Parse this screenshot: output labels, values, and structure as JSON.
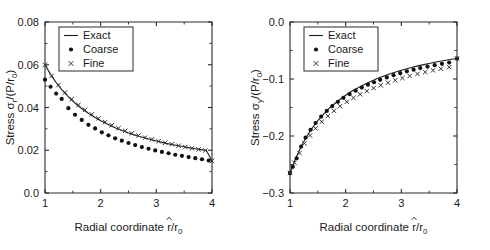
{
  "figure": {
    "background": "#ffffff",
    "foreground": "#1a1a1a",
    "panel_count": 2
  },
  "chart_data": [
    {
      "id": "left",
      "type": "line",
      "title": "",
      "xlabel": "Radial coordinate r̂/r₀",
      "xlabel_parts": {
        "prefix": "Radial coordinate ",
        "hat_var": "r",
        "divider": "/r",
        "sub": "0"
      },
      "ylabel": "Stress σr/(P/r₀)",
      "ylabel_parts": {
        "prefix": "Stress ",
        "sym": "σ",
        "sym_sub": "r",
        "mid": "/(P/r",
        "sub": "0",
        "suffix": ")"
      },
      "xlim": [
        1,
        4
      ],
      "ylim": [
        0.0,
        0.08
      ],
      "xticks": [
        1,
        2,
        3,
        4
      ],
      "xticklabels": [
        "1",
        "2",
        "3",
        "4"
      ],
      "yticks": [
        0.0,
        0.02,
        0.04,
        0.06,
        0.08
      ],
      "yticklabels": [
        "0.0",
        "0.02",
        "0.04",
        "0.06",
        "0.08"
      ],
      "grid": false,
      "legend_position": "upper-left",
      "legend": [
        {
          "label": "Exact",
          "marker": "line"
        },
        {
          "label": "Coarse",
          "marker": "dot"
        },
        {
          "label": "Fine",
          "marker": "x"
        }
      ],
      "series": [
        {
          "name": "Exact",
          "marker": "line",
          "x": [
            1.0,
            1.1,
            1.2,
            1.3,
            1.4,
            1.5,
            1.6,
            1.7,
            1.8,
            1.9,
            2.0,
            2.1,
            2.2,
            2.3,
            2.4,
            2.5,
            2.6,
            2.7,
            2.8,
            2.9,
            3.0,
            3.1,
            3.2,
            3.3,
            3.4,
            3.5,
            3.6,
            3.7,
            3.8,
            3.9,
            4.0
          ],
          "y": [
            0.06,
            0.0555,
            0.0517,
            0.0484,
            0.0455,
            0.043,
            0.0407,
            0.0387,
            0.0369,
            0.0353,
            0.0338,
            0.0325,
            0.0312,
            0.0301,
            0.0291,
            0.0281,
            0.0272,
            0.0264,
            0.0257,
            0.025,
            0.0243,
            0.0237,
            0.0231,
            0.0226,
            0.0221,
            0.0216,
            0.0211,
            0.0207,
            0.0203,
            0.0199,
            0.015
          ]
        },
        {
          "name": "Coarse",
          "marker": "dot",
          "x": [
            1.0,
            1.1,
            1.2,
            1.3,
            1.42,
            1.54,
            1.66,
            1.78,
            1.9,
            2.02,
            2.14,
            2.26,
            2.38,
            2.5,
            2.62,
            2.74,
            2.86,
            2.98,
            3.1,
            3.22,
            3.34,
            3.46,
            3.58,
            3.7,
            3.82,
            3.94
          ],
          "y": [
            0.053,
            0.0497,
            0.0465,
            0.044,
            0.0397,
            0.0366,
            0.0342,
            0.0319,
            0.0302,
            0.0284,
            0.027,
            0.0256,
            0.0245,
            0.0234,
            0.0224,
            0.0215,
            0.0207,
            0.0199,
            0.0192,
            0.0186,
            0.0179,
            0.0174,
            0.0168,
            0.0163,
            0.0158,
            0.0152
          ]
        },
        {
          "name": "Fine",
          "marker": "x",
          "x": [
            1.0,
            1.12,
            1.24,
            1.36,
            1.48,
            1.6,
            1.72,
            1.84,
            1.96,
            2.08,
            2.2,
            2.32,
            2.44,
            2.56,
            2.68,
            2.8,
            2.92,
            3.04,
            3.16,
            3.28,
            3.4,
            3.52,
            3.64,
            3.76,
            3.88,
            4.0
          ],
          "y": [
            0.06,
            0.0548,
            0.0505,
            0.047,
            0.0439,
            0.0412,
            0.0389,
            0.0368,
            0.0349,
            0.0332,
            0.0317,
            0.0303,
            0.0291,
            0.0279,
            0.0269,
            0.0259,
            0.0251,
            0.0242,
            0.0235,
            0.0228,
            0.0221,
            0.0215,
            0.0209,
            0.0204,
            0.0199,
            0.015
          ]
        }
      ]
    },
    {
      "id": "right",
      "type": "line",
      "title": "",
      "xlabel": "Radial coordinate r̂/r₀",
      "xlabel_parts": {
        "prefix": "Radial coordinate ",
        "hat_var": "r",
        "divider": "/r",
        "sub": "0"
      },
      "ylabel": "Stress σy/(P/r₀)",
      "ylabel_parts": {
        "prefix": "Stress ",
        "sym": "σ",
        "sym_sub": "y",
        "mid": "/(P/r",
        "sub": "0",
        "suffix": ")"
      },
      "xlim": [
        1,
        4
      ],
      "ylim": [
        -0.3,
        0.0
      ],
      "xticks": [
        1,
        2,
        3,
        4
      ],
      "xticklabels": [
        "1",
        "2",
        "3",
        "4"
      ],
      "yticks": [
        0.0,
        -0.1,
        -0.2,
        -0.3
      ],
      "yticklabels": [
        "0.0",
        "−0.1",
        "−0.2",
        "−0.3"
      ],
      "grid": false,
      "legend_position": "upper-left",
      "legend": [
        {
          "label": "Exact",
          "marker": "line"
        },
        {
          "label": "Coarse",
          "marker": "dot"
        },
        {
          "label": "Fine",
          "marker": "x"
        }
      ],
      "series": [
        {
          "name": "Exact",
          "marker": "line",
          "x": [
            1.0,
            1.1,
            1.2,
            1.3,
            1.4,
            1.5,
            1.6,
            1.7,
            1.8,
            1.9,
            2.0,
            2.1,
            2.2,
            2.3,
            2.4,
            2.5,
            2.6,
            2.7,
            2.8,
            2.9,
            3.0,
            3.1,
            3.2,
            3.3,
            3.4,
            3.5,
            3.6,
            3.7,
            3.8,
            3.9,
            4.0
          ],
          "y": [
            -0.265,
            -0.24,
            -0.2185,
            -0.201,
            -0.186,
            -0.173,
            -0.162,
            -0.152,
            -0.1435,
            -0.1355,
            -0.1285,
            -0.122,
            -0.1165,
            -0.1112,
            -0.1065,
            -0.102,
            -0.098,
            -0.0943,
            -0.0908,
            -0.0877,
            -0.0847,
            -0.082,
            -0.0794,
            -0.077,
            -0.0748,
            -0.0727,
            -0.0707,
            -0.0688,
            -0.0671,
            -0.0654,
            -0.064
          ]
        },
        {
          "name": "Coarse",
          "marker": "dot",
          "x": [
            1.0,
            1.05,
            1.12,
            1.2,
            1.28,
            1.37,
            1.46,
            1.56,
            1.66,
            1.76,
            1.86,
            1.96,
            2.07,
            2.18,
            2.29,
            2.4,
            2.51,
            2.62,
            2.74,
            2.86,
            2.98,
            3.1,
            3.22,
            3.34,
            3.47,
            3.6,
            3.73,
            3.86,
            4.0
          ],
          "y": [
            -0.265,
            -0.254,
            -0.239,
            -0.2185,
            -0.203,
            -0.189,
            -0.1772,
            -0.166,
            -0.156,
            -0.1475,
            -0.14,
            -0.133,
            -0.1265,
            -0.1205,
            -0.115,
            -0.11,
            -0.1057,
            -0.1015,
            -0.0972,
            -0.0933,
            -0.0898,
            -0.0866,
            -0.0836,
            -0.0809,
            -0.0782,
            -0.0757,
            -0.0733,
            -0.0712,
            -0.064
          ]
        },
        {
          "name": "Fine",
          "marker": "x",
          "x": [
            1.0,
            1.08,
            1.17,
            1.26,
            1.36,
            1.46,
            1.57,
            1.68,
            1.79,
            1.9,
            2.02,
            2.14,
            2.26,
            2.38,
            2.5,
            2.63,
            2.76,
            2.89,
            3.02,
            3.15,
            3.29,
            3.43,
            3.57,
            3.71,
            3.86,
            4.0
          ],
          "y": [
            -0.265,
            -0.247,
            -0.23,
            -0.213,
            -0.199,
            -0.1865,
            -0.175,
            -0.1648,
            -0.1558,
            -0.1478,
            -0.14,
            -0.133,
            -0.1268,
            -0.1212,
            -0.116,
            -0.111,
            -0.1064,
            -0.1022,
            -0.0983,
            -0.0947,
            -0.0911,
            -0.0878,
            -0.0848,
            -0.082,
            -0.0792,
            -0.064
          ]
        }
      ]
    }
  ]
}
